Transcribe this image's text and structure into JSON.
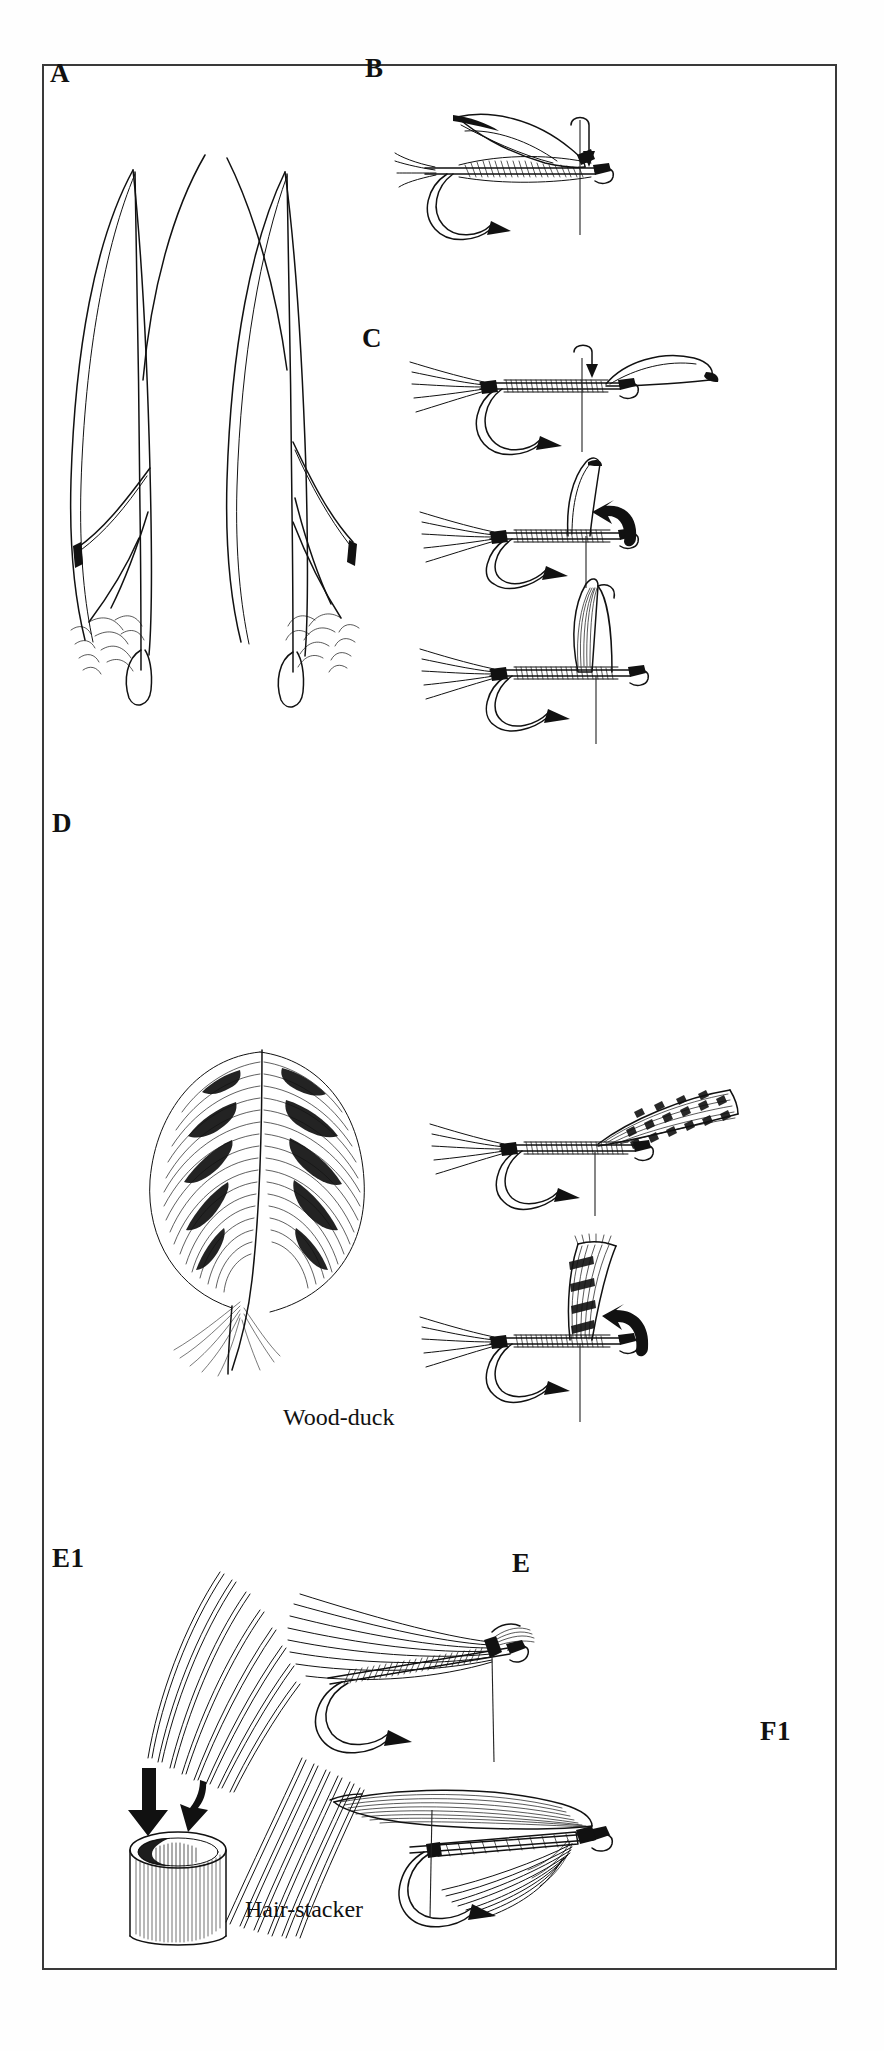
{
  "plate": {
    "title_visible": false,
    "background_color": "#ffffff",
    "frame_color": "#3a3a3a",
    "ink_color": "#111111"
  },
  "panels": [
    {
      "id": "A",
      "label": "A",
      "subject": "matched pair of quill wing slips / primary feathers",
      "label_pos": {
        "x": 50,
        "y": 60
      },
      "caption": null
    },
    {
      "id": "B",
      "label": "B",
      "subject": "dry fly on hook with quill wing being tied in, thread and arrow pointing down",
      "label_pos": {
        "x": 365,
        "y": 55
      },
      "caption": null
    },
    {
      "id": "C",
      "label": "C",
      "subject": "three-step sequence mounting a quill wing onto hook shank",
      "label_pos": {
        "x": 362,
        "y": 325
      },
      "caption": null
    },
    {
      "id": "D",
      "label": "D",
      "subject": "wood-duck flank feather and two-step wing mounting sequence",
      "label_pos": {
        "x": 52,
        "y": 810
      },
      "caption": "Wood-duck"
    },
    {
      "id": "E1",
      "label": "E1",
      "subject": "hair stacker tube with hair bunches and arrows",
      "label_pos": {
        "x": 52,
        "y": 1545
      },
      "caption": "Hair-stacker"
    },
    {
      "id": "E",
      "label": "E",
      "subject": "hair-wing fly tied on hook with thread hanging",
      "label_pos": {
        "x": 512,
        "y": 1550
      },
      "caption": null
    },
    {
      "id": "F1",
      "label": "F1",
      "subject": "finished wet fly with quill wing and hackle over ribbed body",
      "label_pos": {
        "x": 760,
        "y": 1718
      },
      "caption": null
    }
  ],
  "captions": [
    {
      "key": "wood_duck",
      "text": "Wood-duck",
      "x": 283,
      "y": 1405
    },
    {
      "key": "hair_stacker",
      "text": "Hair-stacker",
      "x": 245,
      "y": 1897
    }
  ],
  "labels": [
    {
      "key": "A",
      "text": "A",
      "x": 50,
      "y": 60
    },
    {
      "key": "B",
      "text": "B",
      "x": 365,
      "y": 55
    },
    {
      "key": "C",
      "text": "C",
      "x": 362,
      "y": 325
    },
    {
      "key": "D",
      "text": "D",
      "x": 52,
      "y": 810
    },
    {
      "key": "E1",
      "text": "E1",
      "x": 52,
      "y": 1545
    },
    {
      "key": "E",
      "text": "E",
      "x": 512,
      "y": 1550
    },
    {
      "key": "F1",
      "text": "F1",
      "x": 760,
      "y": 1718
    }
  ],
  "frame": {
    "x": 42,
    "y": 64,
    "width": 795,
    "height": 1906,
    "border_px": 2
  },
  "canvas": {
    "width": 884,
    "height": 2051
  }
}
